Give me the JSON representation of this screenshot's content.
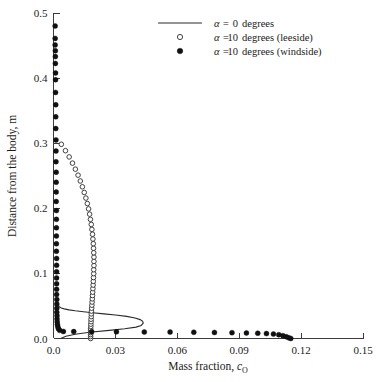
{
  "chart_data": {
    "type": "scatter",
    "title": "",
    "xlabel": "Mass fraction, c_O",
    "xlabel_main": "Mass fraction,",
    "xlabel_symbol": "c",
    "xlabel_subscript": "O",
    "ylabel": "Distance from the body, m",
    "xlim": [
      0.0,
      0.15
    ],
    "ylim": [
      0.0,
      0.5
    ],
    "xticks": [
      0.0,
      0.03,
      0.06,
      0.09,
      0.12,
      0.15
    ],
    "xtick_labels": [
      "0.0",
      "0.03",
      "0.06",
      "0.09",
      "0.12",
      "0.15"
    ],
    "yticks": [
      0.0,
      0.1,
      0.2,
      0.3,
      0.4,
      0.5
    ],
    "ytick_labels": [
      "0.0",
      "0.1",
      "0.2",
      "0.3",
      "0.4",
      "0.5"
    ],
    "grid": false,
    "legend_position": "top-center",
    "series": [
      {
        "name": "alpha-0-degrees",
        "label_prefix": "α =",
        "label_value": "0",
        "label_suffix": "degrees",
        "marker": "line",
        "color": "#2b2b2b",
        "points": [
          [
            0.0035,
            0.0
          ],
          [
            0.006,
            0.0035
          ],
          [
            0.0105,
            0.0065
          ],
          [
            0.0175,
            0.0095
          ],
          [
            0.027,
            0.0125
          ],
          [
            0.0345,
            0.015
          ],
          [
            0.04,
            0.0175
          ],
          [
            0.0425,
            0.02
          ],
          [
            0.0435,
            0.0235
          ],
          [
            0.0432,
            0.0265
          ],
          [
            0.042,
            0.029
          ],
          [
            0.0395,
            0.0315
          ],
          [
            0.0355,
            0.034
          ],
          [
            0.03,
            0.036
          ],
          [
            0.0245,
            0.0378
          ],
          [
            0.019,
            0.0395
          ],
          [
            0.0145,
            0.041
          ],
          [
            0.0105,
            0.0425
          ],
          [
            0.0075,
            0.044
          ],
          [
            0.0052,
            0.0455
          ],
          [
            0.0038,
            0.047
          ],
          [
            0.0028,
            0.049
          ],
          [
            0.0022,
            0.0515
          ],
          [
            0.0018,
            0.0545
          ],
          [
            0.0016,
            0.058
          ],
          [
            0.0014,
            0.0625
          ]
        ]
      },
      {
        "name": "alpha-10-degrees-leeside",
        "label_prefix": "α =",
        "label_value": "10",
        "label_suffix": "degrees (leeside)",
        "marker": "open-circle",
        "color": "#222222",
        "points": [
          [
            0.018,
            0.0
          ],
          [
            0.018,
            0.003
          ],
          [
            0.018,
            0.006
          ],
          [
            0.018,
            0.009
          ],
          [
            0.018,
            0.012
          ],
          [
            0.018,
            0.015
          ],
          [
            0.0181,
            0.0185
          ],
          [
            0.0181,
            0.022
          ],
          [
            0.0182,
            0.0258
          ],
          [
            0.0182,
            0.0296
          ],
          [
            0.0183,
            0.0336
          ],
          [
            0.0183,
            0.0378
          ],
          [
            0.0184,
            0.0421
          ],
          [
            0.0185,
            0.0466
          ],
          [
            0.0186,
            0.0512
          ],
          [
            0.0187,
            0.056
          ],
          [
            0.0188,
            0.0609
          ],
          [
            0.0189,
            0.066
          ],
          [
            0.019,
            0.0712
          ],
          [
            0.0191,
            0.0766
          ],
          [
            0.0192,
            0.0821
          ],
          [
            0.0193,
            0.0878
          ],
          [
            0.0194,
            0.0936
          ],
          [
            0.0195,
            0.0996
          ],
          [
            0.0195,
            0.1057
          ],
          [
            0.0196,
            0.112
          ],
          [
            0.0196,
            0.1184
          ],
          [
            0.0196,
            0.125
          ],
          [
            0.0195,
            0.1317
          ],
          [
            0.0194,
            0.1386
          ],
          [
            0.0193,
            0.1456
          ],
          [
            0.0191,
            0.1528
          ],
          [
            0.0189,
            0.1601
          ],
          [
            0.0186,
            0.1676
          ],
          [
            0.0183,
            0.1752
          ],
          [
            0.0179,
            0.183
          ],
          [
            0.0175,
            0.191
          ],
          [
            0.017,
            0.1991
          ],
          [
            0.0164,
            0.2073
          ],
          [
            0.0157,
            0.2157
          ],
          [
            0.0149,
            0.2243
          ],
          [
            0.014,
            0.233
          ],
          [
            0.013,
            0.2419
          ],
          [
            0.0119,
            0.2509
          ],
          [
            0.0106,
            0.2601
          ],
          [
            0.0092,
            0.2694
          ],
          [
            0.0076,
            0.2789
          ],
          [
            0.0058,
            0.2885
          ],
          [
            0.0038,
            0.2983
          ]
        ]
      },
      {
        "name": "alpha-10-degrees-windside",
        "label_prefix": "α =",
        "label_value": "10",
        "label_suffix": "degrees (windside)",
        "marker": "filled-circle",
        "color": "#111111",
        "points": [
          [
            0.115,
            0.0
          ],
          [
            0.114,
            0.0012
          ],
          [
            0.1128,
            0.0028
          ],
          [
            0.1112,
            0.0044
          ],
          [
            0.1092,
            0.0058
          ],
          [
            0.1066,
            0.0068
          ],
          [
            0.1032,
            0.0076
          ],
          [
            0.099,
            0.0082
          ],
          [
            0.0935,
            0.0086
          ],
          [
            0.0865,
            0.009
          ],
          [
            0.078,
            0.0093
          ],
          [
            0.068,
            0.0096
          ],
          [
            0.0565,
            0.0098
          ],
          [
            0.044,
            0.01
          ],
          [
            0.0305,
            0.0102
          ],
          [
            0.0185,
            0.0104
          ],
          [
            0.0098,
            0.0106
          ],
          [
            0.0048,
            0.0108
          ],
          [
            0.003,
            0.0125
          ],
          [
            0.0024,
            0.015
          ],
          [
            0.0021,
            0.018
          ],
          [
            0.0019,
            0.0215
          ],
          [
            0.0018,
            0.0255
          ],
          [
            0.0017,
            0.03
          ],
          [
            0.0017,
            0.035
          ],
          [
            0.0016,
            0.0405
          ],
          [
            0.0016,
            0.0465
          ],
          [
            0.0016,
            0.053
          ],
          [
            0.0016,
            0.06
          ],
          [
            0.0015,
            0.0675
          ],
          [
            0.0015,
            0.0755
          ],
          [
            0.0015,
            0.084
          ],
          [
            0.0015,
            0.093
          ],
          [
            0.0015,
            0.1025
          ],
          [
            0.0015,
            0.1125
          ],
          [
            0.0015,
            0.123
          ],
          [
            0.0014,
            0.134
          ],
          [
            0.0014,
            0.1455
          ],
          [
            0.0014,
            0.1575
          ],
          [
            0.0014,
            0.17
          ],
          [
            0.0014,
            0.183
          ],
          [
            0.0014,
            0.1965
          ],
          [
            0.0013,
            0.2105
          ],
          [
            0.0013,
            0.225
          ],
          [
            0.0013,
            0.24
          ],
          [
            0.0013,
            0.2555
          ],
          [
            0.0012,
            0.2715
          ],
          [
            0.0012,
            0.288
          ],
          [
            0.0012,
            0.305
          ],
          [
            0.0011,
            0.3225
          ],
          [
            0.0011,
            0.3405
          ],
          [
            0.0011,
            0.359
          ],
          [
            0.001,
            0.378
          ],
          [
            0.001,
            0.3975
          ],
          [
            0.001,
            0.408
          ],
          [
            0.0009,
            0.4225
          ],
          [
            0.0009,
            0.433
          ],
          [
            0.0009,
            0.442
          ],
          [
            0.0008,
            0.451
          ],
          [
            0.0008,
            0.461
          ],
          [
            0.0008,
            0.48
          ]
        ]
      }
    ]
  },
  "legend": {
    "items": [
      {
        "key": "legend-item-alpha-0",
        "symbol": "line",
        "prefix": "α =",
        "value": "0",
        "suffix": "degrees"
      },
      {
        "key": "legend-item-alpha-10-leeside",
        "symbol": "open-circle",
        "prefix": "α =",
        "value": "10",
        "suffix": "degrees (leeside)"
      },
      {
        "key": "legend-item-alpha-10-windside",
        "symbol": "filled-circle",
        "prefix": "α =",
        "value": "10",
        "suffix": "degrees (windside)"
      }
    ]
  }
}
